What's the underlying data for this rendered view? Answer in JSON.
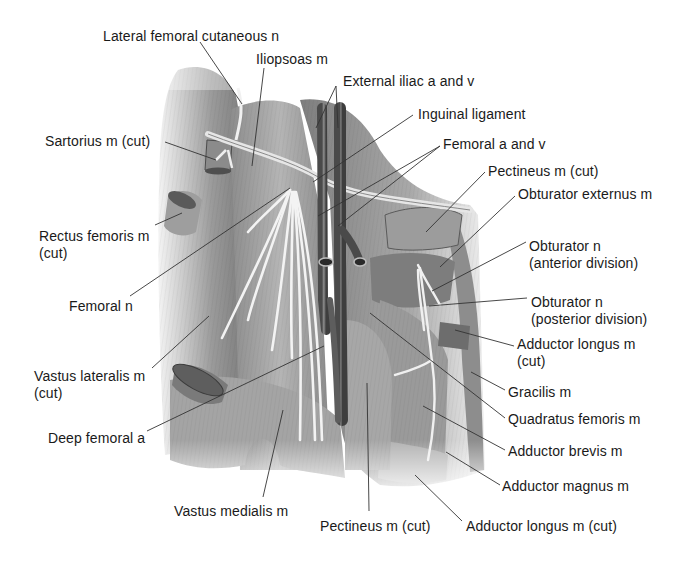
{
  "figure": {
    "labels": [
      {
        "id": "lat-fem-cut-n",
        "lines": [
          "Lateral femoral cutaneous n"
        ],
        "x": 103,
        "y": 28,
        "leaders": [
          [
            200,
            42,
            242,
            104
          ]
        ]
      },
      {
        "id": "iliopsoas",
        "lines": [
          "Iliopsoas m"
        ],
        "x": 256,
        "y": 51,
        "leaders": [
          [
            264,
            68,
            252,
            166
          ]
        ]
      },
      {
        "id": "ext-iliac",
        "lines": [
          "External iliac a and v"
        ],
        "x": 343,
        "y": 73,
        "leaders": [
          [
            336,
            86,
            316,
            128
          ],
          [
            336,
            86,
            338,
            128
          ]
        ]
      },
      {
        "id": "inguinal-lig",
        "lines": [
          "Inguinal ligament"
        ],
        "x": 418,
        "y": 106,
        "leaders": [
          [
            413,
            115,
            313,
            182
          ]
        ]
      },
      {
        "id": "femoral-av",
        "lines": [
          "Femoral a and v"
        ],
        "x": 443,
        "y": 136,
        "leaders": [
          [
            440,
            146,
            318,
            216
          ],
          [
            440,
            146,
            338,
            226
          ]
        ]
      },
      {
        "id": "pectineus-cut-top",
        "lines": [
          "Pectineus m (cut)"
        ],
        "x": 488,
        "y": 163,
        "leaders": [
          [
            485,
            172,
            426,
            232
          ]
        ]
      },
      {
        "id": "obt-ext",
        "lines": [
          "Obturator externus m"
        ],
        "x": 518,
        "y": 186,
        "leaders": [
          [
            515,
            196,
            440,
            267
          ]
        ]
      },
      {
        "id": "obt-n-ant",
        "lines": [
          "Obturator n",
          "(anterior division)"
        ],
        "x": 529,
        "y": 238,
        "leaders": [
          [
            526,
            242,
            432,
            291
          ]
        ]
      },
      {
        "id": "obt-n-post",
        "lines": [
          "Obturator n",
          "(posterior division)"
        ],
        "x": 531,
        "y": 294,
        "leaders": [
          [
            527,
            298,
            429,
            306
          ]
        ]
      },
      {
        "id": "add-longus-cut-mid",
        "lines": [
          "Adductor longus m",
          "(cut)"
        ],
        "x": 517,
        "y": 336,
        "leaders": [
          [
            514,
            346,
            455,
            330
          ]
        ]
      },
      {
        "id": "gracilis",
        "lines": [
          "Gracilis m"
        ],
        "x": 508,
        "y": 384,
        "leaders": [
          [
            505,
            390,
            471,
            372
          ]
        ]
      },
      {
        "id": "quadratus-fem",
        "lines": [
          "Quadratus femoris m"
        ],
        "x": 508,
        "y": 411,
        "leaders": [
          [
            505,
            418,
            370,
            313
          ]
        ]
      },
      {
        "id": "add-brevis",
        "lines": [
          "Adductor brevis m"
        ],
        "x": 508,
        "y": 443,
        "leaders": [
          [
            505,
            450,
            423,
            406
          ]
        ]
      },
      {
        "id": "add-magnus",
        "lines": [
          "Adductor magnus m"
        ],
        "x": 502,
        "y": 478,
        "leaders": [
          [
            500,
            485,
            446,
            452
          ]
        ]
      },
      {
        "id": "add-longus-cut-bottom",
        "lines": [
          "Adductor longus m (cut)"
        ],
        "x": 466,
        "y": 518,
        "leaders": [
          [
            462,
            521,
            415,
            475
          ]
        ]
      },
      {
        "id": "sartorius-cut",
        "lines": [
          "Sartorius m (cut)"
        ],
        "x": 45,
        "y": 133,
        "leaders": [
          [
            165,
            142,
            216,
            160
          ]
        ]
      },
      {
        "id": "rectus-fem-cut",
        "lines": [
          "Rectus femoris m",
          "(cut)"
        ],
        "x": 39,
        "y": 228,
        "leaders": [
          [
            155,
            225,
            182,
            213
          ]
        ]
      },
      {
        "id": "femoral-n",
        "lines": [
          "Femoral n"
        ],
        "x": 69,
        "y": 298,
        "leaders": [
          [
            130,
            296,
            290,
            188
          ]
        ]
      },
      {
        "id": "vastus-lat-cut",
        "lines": [
          "Vastus lateralis m",
          "(cut)"
        ],
        "x": 34,
        "y": 368,
        "leaders": [
          [
            152,
            368,
            209,
            316
          ]
        ]
      },
      {
        "id": "deep-fem-a",
        "lines": [
          "Deep femoral a"
        ],
        "x": 48,
        "y": 430,
        "leaders": [
          [
            147,
            431,
            324,
            346
          ]
        ]
      },
      {
        "id": "vastus-med",
        "lines": [
          "Vastus medialis m"
        ],
        "x": 174,
        "y": 503,
        "leaders": [
          [
            263,
            497,
            283,
            410
          ]
        ]
      },
      {
        "id": "pectineus-cut-bottom",
        "lines": [
          "Pectineus m (cut)"
        ],
        "x": 320,
        "y": 518,
        "leaders": [
          [
            369,
            511,
            367,
            383
          ]
        ]
      }
    ],
    "colors": {
      "text": "#1a1a1a",
      "leader": "#333333",
      "muscle_light": "#d9d9d9",
      "muscle_mid": "#a8a8a8",
      "muscle_dark": "#6e6e6e",
      "vessel": "#555555",
      "nerve": "#f2f2f2"
    }
  }
}
